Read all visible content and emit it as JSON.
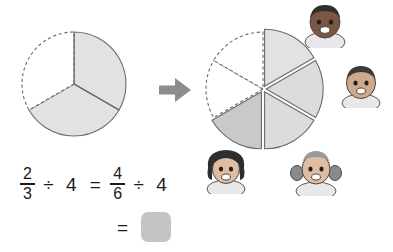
{
  "page": {
    "background_color": "#ffffff"
  },
  "palette": {
    "outline": "#6b6b6b",
    "shade_light": "#e2e2e2",
    "shade_medium": "#cfcfcf",
    "shade_dark": "#bdbdbd",
    "unshaded": "#ffffff",
    "arrow": "#8c8c8c",
    "answer_box": "#c4c4c4",
    "text": "#1a1a1a",
    "skin_dark": "#6d4b3a",
    "skin_medium": "#a8apple",
    "hair_dark": "#3b3b3b"
  },
  "models": {
    "left_circle": {
      "name": "thirds-circle",
      "total_parts": 3,
      "shaded_parts": 2,
      "fraction_label": "2/3",
      "sectors": [
        {
          "index": 0,
          "label": "shaded-right-third",
          "shaded": true,
          "boundary": "solid",
          "start_deg": 0,
          "end_deg": 120
        },
        {
          "index": 1,
          "label": "shaded-bottom-third",
          "shaded": true,
          "boundary": "solid",
          "start_deg": 120,
          "end_deg": 240
        },
        {
          "index": 2,
          "label": "unshaded-left-third",
          "shaded": false,
          "boundary": "dashed",
          "start_deg": 240,
          "end_deg": 360
        }
      ]
    },
    "right_circle": {
      "name": "sixths-circle-exploded",
      "total_parts": 6,
      "shaded_parts": 4,
      "fraction_label": "4/6",
      "exploded": true,
      "sectors": [
        {
          "index": 0,
          "label": "shaded-upper-right-sixth",
          "shaded": true,
          "boundary": "solid",
          "start_deg": 0,
          "end_deg": 60
        },
        {
          "index": 1,
          "label": "shaded-right-sixth",
          "shaded": true,
          "boundary": "solid",
          "start_deg": 60,
          "end_deg": 120
        },
        {
          "index": 2,
          "label": "shaded-lower-right-sixth",
          "shaded": true,
          "boundary": "solid",
          "start_deg": 120,
          "end_deg": 180
        },
        {
          "index": 3,
          "label": "shaded-lower-left-sixth",
          "shaded": true,
          "boundary": "solid",
          "start_deg": 180,
          "end_deg": 240
        },
        {
          "index": 4,
          "label": "unshaded-left-sixth",
          "shaded": false,
          "boundary": "dashed",
          "start_deg": 240,
          "end_deg": 300
        },
        {
          "index": 5,
          "label": "unshaded-upper-left-sixth",
          "shaded": false,
          "boundary": "dashed",
          "start_deg": 300,
          "end_deg": 360
        }
      ]
    }
  },
  "arrow": {
    "name": "right-arrow",
    "direction": "right",
    "color": "#8c8c8c"
  },
  "equation": {
    "line1": {
      "left_fraction": {
        "numerator": "2",
        "denominator": "3"
      },
      "operator1": "÷",
      "divisor1": "4",
      "equals": "=",
      "right_fraction": {
        "numerator": "4",
        "denominator": "6"
      },
      "operator2": "÷",
      "divisor2": "4"
    },
    "line2": {
      "equals": "=",
      "answer_value": "",
      "answer_placeholder": ""
    }
  },
  "avatars": [
    {
      "id": "avatar-top-boy",
      "name": "student-face-boy-dark-hair",
      "position": "top-right-of-circle"
    },
    {
      "id": "avatar-right-boy",
      "name": "student-face-boy-short-hair",
      "position": "right-of-circle"
    },
    {
      "id": "avatar-left-girl",
      "name": "student-face-girl-curly-hair",
      "position": "bottom-left-of-circle"
    },
    {
      "id": "avatar-right-girl",
      "name": "student-face-girl-pigtails",
      "position": "bottom-right-of-circle"
    }
  ]
}
